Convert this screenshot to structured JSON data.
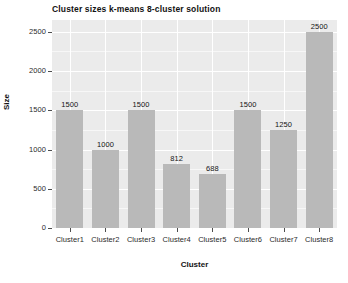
{
  "chart_data": {
    "type": "bar",
    "title": "Cluster sizes k-means 8-cluster solution",
    "xlabel": "Cluster",
    "ylabel": "Size",
    "categories": [
      "Cluster1",
      "Cluster2",
      "Cluster3",
      "Cluster4",
      "Cluster5",
      "Cluster6",
      "Cluster7",
      "Cluster8"
    ],
    "values": [
      1500,
      1000,
      1500,
      812,
      688,
      1500,
      1250,
      2500
    ],
    "data_labels": [
      "1500",
      "1000",
      "1500",
      "812",
      "688",
      "1500",
      "1250",
      "2500"
    ],
    "ylim": [
      0,
      2650
    ],
    "yticks": [
      0,
      500,
      1000,
      1500,
      2000,
      2500
    ],
    "ytick_labels": [
      "0",
      "500",
      "1000",
      "1500",
      "2000",
      "2500"
    ],
    "grid": true,
    "legend": "none",
    "bar_color": "#b9b9b9",
    "panel_color": "#ebebeb",
    "grid_color": "#ffffff",
    "text_color": "#1a1a1a"
  }
}
